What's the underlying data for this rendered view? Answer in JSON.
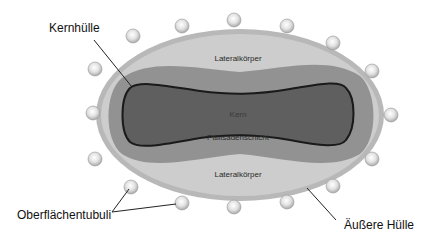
{
  "diagram": {
    "external_labels": {
      "kernhulle": "Kernhülle",
      "oberflachentubuli": "Oberflächentubuli",
      "aussere_hulle": "Äußere Hülle"
    },
    "internal_labels": {
      "lateral_top": "Lateralkörper",
      "kern": "Kern",
      "pallisaden": "Pallisadenschicht",
      "lateral_bottom": "Lateralkörper"
    },
    "colors": {
      "outer_shell": "#c9c9c9",
      "outer_rim": "#b5b5b5",
      "pallisade_layer": "#8f8f8f",
      "core": "#5e5e5e",
      "core_outline": "#1e1e1e",
      "tubuli": "#d8d8d8"
    }
  }
}
